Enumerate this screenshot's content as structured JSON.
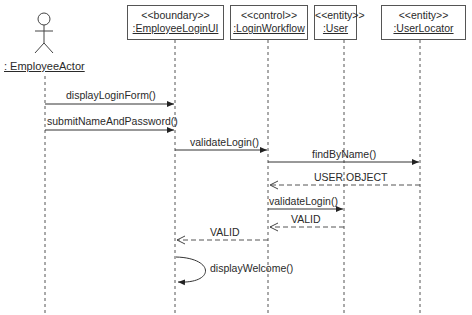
{
  "diagram_type": "UML Sequence Diagram",
  "participants": [
    {
      "id": "actor",
      "kind": "actor",
      "label": ": EmployeeActor"
    },
    {
      "id": "boundary",
      "kind": "object",
      "stereotype": "<<boundary>>",
      "label": ":EmployeeLoginUI"
    },
    {
      "id": "control",
      "kind": "object",
      "stereotype": "<<control>>",
      "label": ":LoginWorkflow"
    },
    {
      "id": "user",
      "kind": "object",
      "stereotype": "<<entity>>",
      "label": ":User"
    },
    {
      "id": "locator",
      "kind": "object",
      "stereotype": "<<entity>>",
      "label": ":UserLocator"
    }
  ],
  "messages": [
    {
      "from": "actor",
      "to": "boundary",
      "label": "displayLoginForm()",
      "type": "sync"
    },
    {
      "from": "actor",
      "to": "boundary",
      "label": "submitNameAndPassword()",
      "type": "sync"
    },
    {
      "from": "boundary",
      "to": "control",
      "label": "validateLogin()",
      "type": "sync"
    },
    {
      "from": "control",
      "to": "locator",
      "label": "findByName()",
      "type": "sync"
    },
    {
      "from": "locator",
      "to": "control",
      "label": "USER OBJECT",
      "type": "return"
    },
    {
      "from": "control",
      "to": "user",
      "label": "validateLogin()",
      "type": "sync"
    },
    {
      "from": "user",
      "to": "control",
      "label": "VALID",
      "type": "return"
    },
    {
      "from": "control",
      "to": "boundary",
      "label": "VALID",
      "type": "return"
    },
    {
      "from": "boundary",
      "to": "boundary",
      "label": "displayWelcome()",
      "type": "self"
    }
  ]
}
